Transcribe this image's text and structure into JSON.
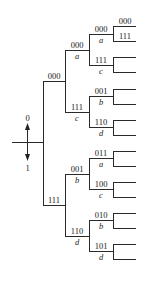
{
  "diagram": {
    "type": "code-tree",
    "direction_labels": {
      "up": "0",
      "down": "1"
    },
    "root_branches": [
      {
        "code": "000",
        "children": [
          {
            "code": "000",
            "symbol": "a",
            "children": [
              {
                "code": "000",
                "symbol": "a",
                "leaves": [
                  "000",
                  "111"
                ]
              },
              {
                "code": "111",
                "symbol": "c",
                "leaves": [
                  "",
                  ""
                ]
              }
            ]
          },
          {
            "code": "111",
            "symbol": "c",
            "children": [
              {
                "code": "001",
                "symbol": "b",
                "leaves": [
                  "",
                  ""
                ]
              },
              {
                "code": "110",
                "symbol": "d",
                "leaves": [
                  "",
                  ""
                ]
              }
            ]
          }
        ]
      },
      {
        "code": "111",
        "children": [
          {
            "code": "001",
            "symbol": "b",
            "children": [
              {
                "code": "011",
                "symbol": "a",
                "leaves": [
                  "",
                  ""
                ]
              },
              {
                "code": "100",
                "symbol": "c",
                "leaves": [
                  "",
                  ""
                ]
              }
            ]
          },
          {
            "code": "110",
            "symbol": "d",
            "children": [
              {
                "code": "010",
                "symbol": "b",
                "leaves": [
                  "",
                  ""
                ]
              },
              {
                "code": "101",
                "symbol": "d",
                "leaves": [
                  "",
                  ""
                ]
              }
            ]
          }
        ]
      }
    ]
  },
  "labels": {
    "l1_top": "000",
    "l1_bot": "111",
    "l2_0_code": "000",
    "l2_0_sym": "a",
    "l2_1_code": "111",
    "l2_1_sym": "c",
    "l2_2_code": "001",
    "l2_2_sym": "b",
    "l2_3_code": "110",
    "l2_3_sym": "d",
    "l3_0_code": "000",
    "l3_0_sym": "a",
    "l3_1_code": "111",
    "l3_1_sym": "c",
    "l3_2_code": "001",
    "l3_2_sym": "b",
    "l3_3_code": "110",
    "l3_3_sym": "d",
    "l3_4_code": "011",
    "l3_4_sym": "a",
    "l3_5_code": "100",
    "l3_5_sym": "c",
    "l3_6_code": "010",
    "l3_6_sym": "b",
    "l3_7_code": "101",
    "l3_7_sym": "d",
    "leaf_0": "000",
    "leaf_1": "111",
    "arrow_up": "0",
    "arrow_down": "1"
  }
}
